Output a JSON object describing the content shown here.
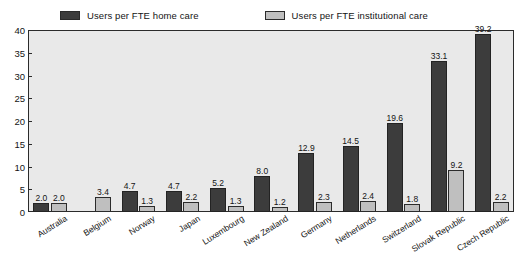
{
  "chart_data": {
    "type": "bar",
    "title": "",
    "subtitle": "",
    "xlabel": "",
    "ylabel": "",
    "ylim": [
      0,
      40
    ],
    "yticks": [
      0,
      5,
      10,
      15,
      20,
      25,
      30,
      35,
      40
    ],
    "grid": false,
    "legend_position": "top",
    "categories": [
      "Australia",
      "Belgium",
      "Norway",
      "Japan",
      "Luxembourg",
      "New Zealand",
      "Germany",
      "Netherlands",
      "Switzerland",
      "Slovak Republic",
      "Czech Republic"
    ],
    "series": [
      {
        "name": "Users per FTE home care",
        "color": "#3c3c3c",
        "values": [
          2.0,
          null,
          4.7,
          4.7,
          5.2,
          8.0,
          12.9,
          14.5,
          19.6,
          33.1,
          39.2
        ],
        "labels": [
          "2.0",
          "",
          "4.7",
          "4.7",
          "5.2",
          "8.0",
          "12.9",
          "14.5",
          "19.6",
          "33.1",
          "39.2"
        ]
      },
      {
        "name": "Users per FTE institutional care",
        "color": "#bfbfbf",
        "values": [
          2.0,
          3.4,
          1.3,
          2.2,
          1.3,
          1.2,
          2.3,
          2.4,
          1.8,
          9.2,
          2.2
        ],
        "labels": [
          "2.0",
          "3.4",
          "1.3",
          "2.2",
          "1.3",
          "1.2",
          "2.3",
          "2.4",
          "1.8",
          "9.2",
          "2.2"
        ]
      }
    ]
  },
  "legend": {
    "entries": [
      {
        "label": "Users per FTE home care",
        "swatch": "dark"
      },
      {
        "label": "Users per FTE institutional care",
        "swatch": "light"
      }
    ]
  }
}
